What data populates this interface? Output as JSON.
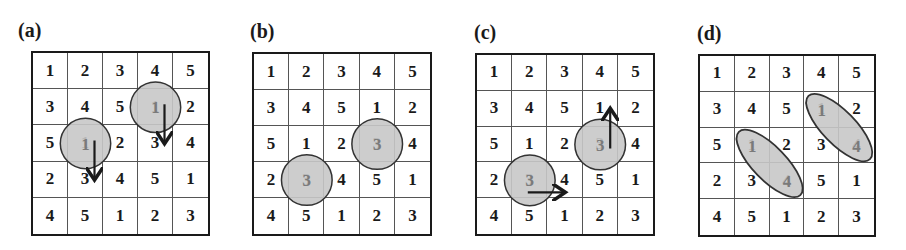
{
  "colors": {
    "grid_line": "#1a1a1a",
    "highlight_fill": "#c8c8c8",
    "highlight_stroke": "#333333",
    "highlight_text": "#7a7a7a",
    "arrow": "#1a1a1a"
  },
  "panels": [
    {
      "label": "(a)",
      "rows": [
        [
          "1",
          "2",
          "3",
          "4",
          "5"
        ],
        [
          "3",
          "4",
          "5",
          "1",
          "2"
        ],
        [
          "5",
          "1",
          "2",
          "3",
          "4"
        ],
        [
          "2",
          "3",
          "4",
          "5",
          "1"
        ],
        [
          "4",
          "5",
          "1",
          "2",
          "3"
        ]
      ],
      "highlights": [
        {
          "shape": "circle",
          "cell": [
            2,
            1
          ],
          "value": "1",
          "arrow": "down"
        },
        {
          "shape": "circle",
          "cell": [
            1,
            3
          ],
          "value": "1",
          "arrow": "down"
        }
      ]
    },
    {
      "label": "(b)",
      "rows": [
        [
          "1",
          "2",
          "3",
          "4",
          "5"
        ],
        [
          "3",
          "4",
          "5",
          "1",
          "2"
        ],
        [
          "5",
          "1",
          "2",
          "3",
          "4"
        ],
        [
          "2",
          "3",
          "4",
          "5",
          "1"
        ],
        [
          "4",
          "5",
          "1",
          "2",
          "3"
        ]
      ],
      "highlights": [
        {
          "shape": "circle",
          "cell": [
            3,
            1
          ],
          "value": "3"
        },
        {
          "shape": "circle",
          "cell": [
            2,
            3
          ],
          "value": "3"
        }
      ]
    },
    {
      "label": "(c)",
      "rows": [
        [
          "1",
          "2",
          "3",
          "4",
          "5"
        ],
        [
          "3",
          "4",
          "5",
          "1",
          "2"
        ],
        [
          "5",
          "1",
          "2",
          "3",
          "4"
        ],
        [
          "2",
          "3",
          "4",
          "5",
          "1"
        ],
        [
          "4",
          "5",
          "1",
          "2",
          "3"
        ]
      ],
      "highlights": [
        {
          "shape": "circle",
          "cell": [
            3,
            1
          ],
          "value": "3",
          "arrow": "right"
        },
        {
          "shape": "circle",
          "cell": [
            2,
            3
          ],
          "value": "3",
          "arrow": "up"
        }
      ]
    },
    {
      "label": "(d)",
      "rows": [
        [
          "1",
          "2",
          "3",
          "4",
          "5"
        ],
        [
          "3",
          "4",
          "5",
          "1",
          "2"
        ],
        [
          "5",
          "1",
          "2",
          "3",
          "4"
        ],
        [
          "2",
          "3",
          "4",
          "5",
          "1"
        ],
        [
          "4",
          "5",
          "1",
          "2",
          "3"
        ]
      ],
      "highlights": [
        {
          "shape": "ellipse",
          "cells": [
            [
              2,
              1
            ],
            [
              3,
              2
            ]
          ],
          "values": [
            "1",
            "4"
          ]
        },
        {
          "shape": "ellipse",
          "cells": [
            [
              1,
              3
            ],
            [
              2,
              4
            ]
          ],
          "values": [
            "1",
            "4"
          ]
        }
      ]
    }
  ]
}
